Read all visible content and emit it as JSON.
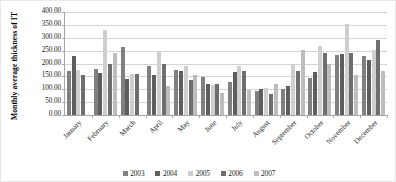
{
  "chart_data": {
    "type": "bar",
    "title": "",
    "xlabel": "",
    "ylabel": "Monthly average thickness of IT",
    "ylim": [
      0,
      400
    ],
    "ytick_step": 50,
    "ytick_labels": [
      "400.00",
      "350.00",
      "300.00",
      "250.00",
      "200.00",
      "150.00",
      "100.00",
      "50.00",
      "0.00"
    ],
    "grid": true,
    "legend_position": "bottom",
    "categories": [
      "January",
      "February",
      "March",
      "April",
      "May",
      "June",
      "July",
      "August",
      "September",
      "October",
      "November",
      "December"
    ],
    "series": [
      {
        "name": "2003",
        "color": "#808080",
        "values": [
          170,
          180,
          265,
          190,
          175,
          147,
          130,
          95,
          100,
          145,
          232,
          228
        ]
      },
      {
        "name": "2004",
        "color": "#5e5e5e",
        "values": [
          230,
          162,
          140,
          157,
          172,
          120,
          167,
          100,
          112,
          168,
          238,
          215
        ]
      },
      {
        "name": "2005",
        "color": "#cfcfcf",
        "values": [
          175,
          330,
          158,
          245,
          190,
          118,
          192,
          105,
          198,
          268,
          352,
          252
        ]
      },
      {
        "name": "2006",
        "color": "#6e6e6e",
        "values": [
          155,
          200,
          160,
          200,
          135,
          120,
          170,
          80,
          172,
          240,
          240,
          290
        ]
      },
      {
        "name": "2007",
        "color": "#bdbdbd",
        "values": [
          null,
          240,
          null,
          112,
          155,
          85,
          97,
          122,
          252,
          200,
          155,
          172
        ]
      }
    ]
  },
  "legend": {
    "items": [
      {
        "label": "2003"
      },
      {
        "label": "2004"
      },
      {
        "label": "2005"
      },
      {
        "label": "2006"
      },
      {
        "label": "2007"
      }
    ]
  }
}
